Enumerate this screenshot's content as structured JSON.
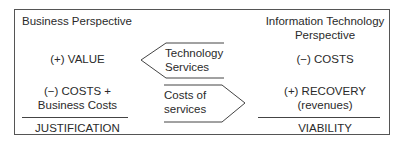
{
  "left": {
    "heading": "Business Perspective",
    "value": "(+) VALUE",
    "costs_line1": "(−) COSTS +",
    "costs_line2": "Business Costs",
    "footer": "JUSTIFICATION"
  },
  "right": {
    "heading_line1": "Information Technology",
    "heading_line2": "Perspective",
    "costs": "(−) COSTS",
    "recovery_line1": "(+) RECOVERY",
    "recovery_line2": "(revenues)",
    "footer": "VIABILITY"
  },
  "arrows": {
    "top": {
      "direction": "left",
      "line1": "Technology",
      "line2": "Services"
    },
    "bottom": {
      "direction": "right",
      "line1": "Costs of",
      "line2": "services"
    }
  }
}
